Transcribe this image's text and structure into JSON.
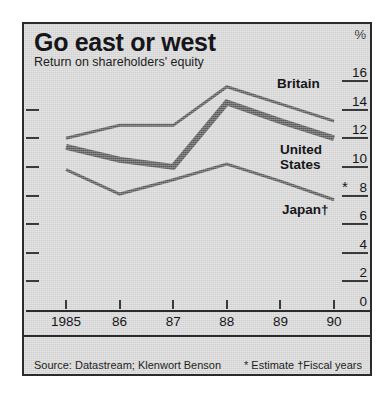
{
  "figure": {
    "title": "Go east or west",
    "subtitle": "Return on shareholders' equity",
    "percent_symbol": "%",
    "source_note": "Source: Datastream; Klenwort Benson",
    "notes_note": "* Estimate †Fiscal years",
    "estimate_marker": "*",
    "background_color": "#d7d7d7",
    "frame_color": "#2b2b2b",
    "line_color": "#5a5a5a",
    "text_color": "#16161a"
  },
  "labels": {
    "britain": "Britain",
    "united_states_line1": "United",
    "united_states_line2": "States",
    "japan": "Japan†"
  },
  "chart_data": {
    "type": "line",
    "title": "Go east or west",
    "subtitle": "Return on shareholders' equity",
    "xlabel": "",
    "ylabel": "%",
    "ylim": [
      0,
      16
    ],
    "y_ticks": [
      16,
      14,
      12,
      10,
      8,
      6,
      4,
      2,
      0
    ],
    "y_tick_labels": [
      "16",
      "14",
      "12",
      "10",
      "8",
      "6",
      "4",
      "2",
      "0"
    ],
    "x": [
      1985,
      1986,
      1987,
      1988,
      1989,
      1990
    ],
    "categories": [
      "1985",
      "86",
      "87",
      "88",
      "89",
      "90"
    ],
    "grid": false,
    "legend": "inline-right",
    "series": [
      {
        "name": "Britain",
        "values": [
          12.0,
          12.9,
          12.9,
          15.6,
          14.4,
          13.2
        ],
        "line_width": 3,
        "color": "#5a5a5a"
      },
      {
        "name": "United States",
        "values": [
          11.4,
          10.5,
          10.0,
          14.5,
          13.2,
          12.0
        ],
        "line_width": 6,
        "color": "#5a5a5a"
      },
      {
        "name": "Japan†",
        "values": [
          9.8,
          8.1,
          9.1,
          10.2,
          9.0,
          7.7
        ],
        "line_width": 3,
        "color": "#5a5a5a"
      }
    ],
    "annotations": [
      {
        "text": "*",
        "note": "Estimate marker at 1990 Japan point"
      }
    ]
  }
}
